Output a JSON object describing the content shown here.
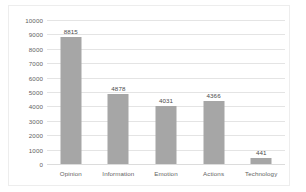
{
  "chart_data": {
    "type": "bar",
    "title": "",
    "xlabel": "",
    "ylabel": "",
    "categories": [
      "Opinion",
      "Information",
      "Emotion",
      "Actions",
      "Technology"
    ],
    "values": [
      8815,
      4878,
      4031,
      4366,
      441
    ],
    "data_labels": [
      "8815",
      "4878",
      "4031",
      "4366",
      "441"
    ],
    "ylim": [
      0,
      10000
    ],
    "ytick_step": 1000,
    "ytick_labels": [
      "10000",
      "9000",
      "8000",
      "7000",
      "6000",
      "5000",
      "4000",
      "3000",
      "2000",
      "1000",
      "0"
    ],
    "grid": true,
    "legend": false,
    "legend_position": "none",
    "bar_color": "#a6a6a6",
    "gridline_color": "#e4e4e4",
    "text_color": "#5f5f5f",
    "frame_color": "#ededed"
  }
}
